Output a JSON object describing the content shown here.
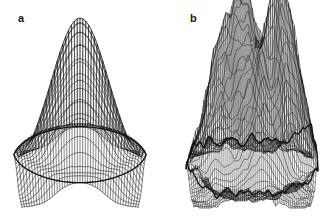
{
  "figure": {
    "background_color": "#ffffff",
    "ink_color": "#111111",
    "width": 336,
    "height": 219,
    "panel_count": 2,
    "caption_style": "bold lowercase letters at upper-left of each panel"
  },
  "panels": [
    {
      "id": "a",
      "label": "a",
      "label_x": 18,
      "label_y": 13,
      "plot_type": "3d-wireframe-surface",
      "description": "single smooth unimodal cone-shaped peak rising from a flared circular base",
      "peak_count": 1,
      "apex_x": 78,
      "apex_y": 18,
      "base_center_x": 80,
      "base_center_y": 180,
      "base_radius_x": 66,
      "base_radius_y": 28,
      "mesh_u_lines": 46,
      "mesh_v_lines": 26,
      "surface_roughness": 0.0,
      "peaks": [
        {
          "u": 0.5,
          "v": 0.5,
          "height": 1.0,
          "sigma": 0.22
        }
      ]
    },
    {
      "id": "b",
      "label": "b",
      "label_x": 22,
      "label_y": 13,
      "plot_type": "3d-wireframe-surface",
      "description": "rugged multimodal landscape with five sharp needle-like peaks of unequal height on a noisy flared base",
      "peak_count": 5,
      "apex_x": 102,
      "apex_y": 30,
      "base_center_x": 84,
      "base_center_y": 180,
      "base_radius_x": 66,
      "base_radius_y": 28,
      "mesh_u_lines": 64,
      "mesh_v_lines": 40,
      "surface_roughness": 0.085,
      "peaks": [
        {
          "u": 0.26,
          "v": 0.42,
          "height": 0.86,
          "sigma": 0.115
        },
        {
          "u": 0.46,
          "v": 0.34,
          "height": 1.0,
          "sigma": 0.095
        },
        {
          "u": 0.58,
          "v": 0.55,
          "height": 0.7,
          "sigma": 0.09
        },
        {
          "u": 0.7,
          "v": 0.46,
          "height": 0.66,
          "sigma": 0.085
        },
        {
          "u": 0.8,
          "v": 0.36,
          "height": 0.92,
          "sigma": 0.1
        }
      ]
    }
  ],
  "chart_data": {
    "type": "surface",
    "title": "",
    "subtitle": "",
    "xlabel": "",
    "ylabel": "",
    "zlabel": "",
    "legend": [],
    "grid": false,
    "render": "black wireframe mesh, no axes, no tick labels, white background",
    "series": [
      {
        "name": "a",
        "label": "a",
        "peak_count": 1,
        "roughness": 0.0,
        "peaks": [
          {
            "u": 0.5,
            "v": 0.5,
            "height": 1.0,
            "sigma": 0.22
          }
        ]
      },
      {
        "name": "b",
        "label": "b",
        "peak_count": 5,
        "roughness": 0.085,
        "peaks": [
          {
            "u": 0.26,
            "v": 0.42,
            "height": 0.86,
            "sigma": 0.115
          },
          {
            "u": 0.46,
            "v": 0.34,
            "height": 1.0,
            "sigma": 0.095
          },
          {
            "u": 0.58,
            "v": 0.55,
            "height": 0.7,
            "sigma": 0.09
          },
          {
            "u": 0.7,
            "v": 0.46,
            "height": 0.66,
            "sigma": 0.085
          },
          {
            "u": 0.8,
            "v": 0.36,
            "height": 0.92,
            "sigma": 0.1
          }
        ]
      }
    ]
  }
}
